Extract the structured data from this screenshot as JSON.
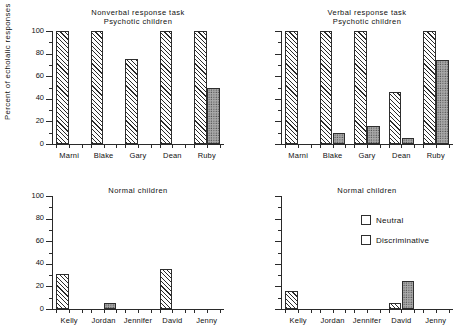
{
  "figure": {
    "ylabel": "Percent of echolalic responses"
  },
  "legend": {
    "items": [
      {
        "label": "Neutral",
        "pattern": "diagonal-hatch"
      },
      {
        "label": "Discriminative",
        "pattern": "gray-stipple"
      }
    ]
  },
  "axis": {
    "yticks": [
      "0",
      "20",
      "40",
      "60",
      "80",
      "100"
    ],
    "ymin": 0,
    "ymax": 100
  },
  "panels": [
    {
      "id": "nonverbal-psychotic",
      "title_line1": "Nonverbal response task",
      "title_line2": "Psychotic children",
      "categories": [
        "Marni",
        "Blake",
        "Gary",
        "Dean",
        "Ruby"
      ],
      "neutral": [
        100,
        100,
        75,
        100,
        100
      ],
      "discriminative": [
        0,
        0,
        0,
        0,
        50
      ]
    },
    {
      "id": "verbal-psychotic",
      "title_line1": "Verbal response task",
      "title_line2": "Psychotic children",
      "categories": [
        "Marni",
        "Blake",
        "Gary",
        "Dean",
        "Ruby"
      ],
      "neutral": [
        100,
        100,
        100,
        46,
        100
      ],
      "discriminative": [
        0,
        10,
        16,
        5,
        74
      ]
    },
    {
      "id": "nonverbal-normal",
      "title_line1": "",
      "title_line2": "Normal children",
      "categories": [
        "Kelly",
        "Jordan",
        "Jennifer",
        "David",
        "Jenny"
      ],
      "neutral": [
        31,
        0,
        0,
        35,
        0
      ],
      "discriminative": [
        0,
        5,
        0,
        0,
        0
      ]
    },
    {
      "id": "verbal-normal",
      "title_line1": "",
      "title_line2": "Normal children",
      "categories": [
        "Kelly",
        "Jordan",
        "Jennifer",
        "David",
        "Jenny"
      ],
      "neutral": [
        16,
        0,
        0,
        5,
        0
      ],
      "discriminative": [
        0,
        0,
        0,
        25,
        0
      ]
    }
  ],
  "chart_data": {
    "type": "bar",
    "xlabel": "",
    "ylabel": "Percent of echolalic responses",
    "ylim": [
      0,
      100
    ],
    "ytick_values": [
      0,
      20,
      40,
      60,
      80,
      100
    ],
    "grid": false,
    "legend_position": "inside bottom-right panel, upper right",
    "legend_entries": [
      "Neutral",
      "Discriminative"
    ],
    "panels": [
      {
        "panel": "Nonverbal response task / Psychotic children",
        "categories": [
          "Marni",
          "Blake",
          "Gary",
          "Dean",
          "Ruby"
        ],
        "series": [
          {
            "name": "Neutral",
            "values": [
              100,
              100,
              75,
              100,
              100
            ]
          },
          {
            "name": "Discriminative",
            "values": [
              0,
              0,
              0,
              0,
              50
            ]
          }
        ]
      },
      {
        "panel": "Verbal response task / Psychotic children",
        "categories": [
          "Marni",
          "Blake",
          "Gary",
          "Dean",
          "Ruby"
        ],
        "series": [
          {
            "name": "Neutral",
            "values": [
              100,
              100,
              100,
              46,
              100
            ]
          },
          {
            "name": "Discriminative",
            "values": [
              0,
              10,
              16,
              5,
              74
            ]
          }
        ]
      },
      {
        "panel": "Nonverbal response task / Normal children",
        "categories": [
          "Kelly",
          "Jordan",
          "Jennifer",
          "David",
          "Jenny"
        ],
        "series": [
          {
            "name": "Neutral",
            "values": [
              31,
              0,
              0,
              35,
              0
            ]
          },
          {
            "name": "Discriminative",
            "values": [
              0,
              5,
              0,
              0,
              0
            ]
          }
        ]
      },
      {
        "panel": "Verbal response task / Normal children",
        "categories": [
          "Kelly",
          "Jordan",
          "Jennifer",
          "David",
          "Jenny"
        ],
        "series": [
          {
            "name": "Neutral",
            "values": [
              16,
              0,
              0,
              5,
              0
            ]
          },
          {
            "name": "Discriminative",
            "values": [
              0,
              0,
              0,
              25,
              0
            ]
          }
        ]
      }
    ]
  }
}
